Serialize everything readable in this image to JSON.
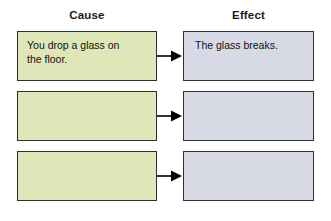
{
  "diagram": {
    "type": "cause-and-effect-graphic-organizer",
    "headers": {
      "cause": "Cause",
      "effect": "Effect"
    },
    "colors": {
      "cause_fill": "#dfe7b9",
      "effect_fill": "#d7dae5",
      "border": "#2e2e2e",
      "arrow": "#000000",
      "background": "#ffffff",
      "text": "#101010"
    },
    "rows": [
      {
        "cause": "You drop a glass on\nthe floor.",
        "effect": "The glass breaks.",
        "connector": "arrow-right"
      },
      {
        "cause": "",
        "effect": "",
        "connector": "arrow-right"
      },
      {
        "cause": "",
        "effect": "",
        "connector": "arrow-right"
      }
    ]
  }
}
